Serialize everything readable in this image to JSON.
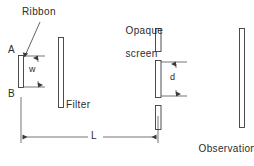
{
  "figure": {
    "background_color": "#ffffff",
    "stroke_color": "#3a3a3a",
    "text_color": "#2b2b2b",
    "labels": {
      "ribbon": "Ribbon",
      "point_a": "A",
      "point_b": "B",
      "width_w": "w",
      "filter": "Filter",
      "opaque_screen_line1": "Opaque",
      "opaque_screen_line2": "screen",
      "slit_separation_d": "d",
      "distance_l": "L",
      "observation_screen_line1": "Observation",
      "observation_screen_line2": "screen"
    },
    "elements": [
      {
        "name": "ribbon",
        "kind": "bar",
        "x": 18,
        "y": 55,
        "w": 6,
        "h": 33
      },
      {
        "name": "filter",
        "kind": "bar",
        "x": 58,
        "y": 37,
        "w": 6,
        "h": 71
      },
      {
        "name": "opaque-screen-top",
        "kind": "bar",
        "x": 155,
        "y": 28,
        "w": 6,
        "h": 24
      },
      {
        "name": "opaque-screen-mid",
        "kind": "bar",
        "x": 155,
        "y": 60,
        "w": 6,
        "h": 38
      },
      {
        "name": "opaque-screen-bot",
        "kind": "bar",
        "x": 155,
        "y": 105,
        "w": 6,
        "h": 25
      },
      {
        "name": "observation-screen",
        "kind": "bar",
        "x": 239,
        "y": 28,
        "w": 6,
        "h": 100
      }
    ],
    "dimensions": [
      {
        "name": "w",
        "label": "w",
        "orientation": "vertical",
        "from": 56,
        "to": 87,
        "axis_x": 38
      },
      {
        "name": "d",
        "label": "d",
        "orientation": "vertical",
        "from": 62,
        "to": 96,
        "axis_x": 176
      },
      {
        "name": "L",
        "label": "L",
        "orientation": "horizontal",
        "from": 22,
        "to": 157,
        "axis_y": 137
      }
    ]
  }
}
